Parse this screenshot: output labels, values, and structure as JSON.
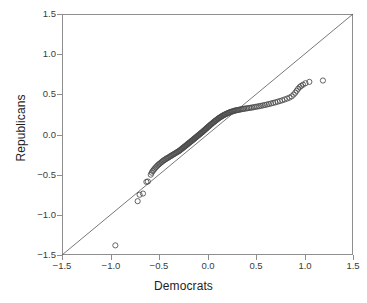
{
  "chart_data": {
    "type": "scatter",
    "title": "",
    "subtitle": "",
    "xlabel": "Democrats",
    "ylabel": "Republicans",
    "xlim": [
      -1.5,
      1.5
    ],
    "ylim": [
      -1.5,
      1.5
    ],
    "xticks": [
      "-1.5",
      "-1.0",
      "-0.5",
      "0.0",
      "0.5",
      "1.0",
      "1.5"
    ],
    "yticks": [
      "1.5",
      "1.0",
      "0.5",
      "0.0",
      "-0.5",
      "-1.0",
      "-1.5"
    ],
    "xtick_values": [
      -1.5,
      -1.0,
      -0.5,
      0.0,
      0.5,
      1.0,
      1.5
    ],
    "ytick_values": [
      1.5,
      1.0,
      0.5,
      0.0,
      -0.5,
      -1.0,
      -1.5
    ],
    "grid": false,
    "legend": "none",
    "annotations": [],
    "marker": {
      "shape": "open-circle",
      "radius": 2.6,
      "color": "#4a4a4a",
      "fill": "none"
    },
    "reference_line": {
      "name": "identity-line",
      "label": "y = x",
      "from": [
        -1.5,
        -1.5
      ],
      "to": [
        1.5,
        1.5
      ],
      "color": "#555555",
      "width": 0.8
    },
    "series": [
      {
        "name": "quantile-pairs",
        "points": [
          [
            -0.95,
            -1.38
          ],
          [
            -0.72,
            -0.83
          ],
          [
            -0.7,
            -0.75
          ],
          [
            -0.665,
            -0.735
          ],
          [
            -0.63,
            -0.59
          ],
          [
            -0.615,
            -0.585
          ],
          [
            -0.585,
            -0.5
          ],
          [
            -0.575,
            -0.475
          ],
          [
            -0.565,
            -0.455
          ],
          [
            -0.555,
            -0.44
          ],
          [
            -0.545,
            -0.425
          ],
          [
            -0.535,
            -0.41
          ],
          [
            -0.525,
            -0.4
          ],
          [
            -0.515,
            -0.385
          ],
          [
            -0.505,
            -0.375
          ],
          [
            -0.495,
            -0.365
          ],
          [
            -0.485,
            -0.355
          ],
          [
            -0.475,
            -0.345
          ],
          [
            -0.465,
            -0.335
          ],
          [
            -0.455,
            -0.325
          ],
          [
            -0.445,
            -0.318
          ],
          [
            -0.435,
            -0.31
          ],
          [
            -0.425,
            -0.3
          ],
          [
            -0.415,
            -0.295
          ],
          [
            -0.405,
            -0.288
          ],
          [
            -0.395,
            -0.28
          ],
          [
            -0.385,
            -0.272
          ],
          [
            -0.375,
            -0.265
          ],
          [
            -0.365,
            -0.258
          ],
          [
            -0.355,
            -0.25
          ],
          [
            -0.345,
            -0.243
          ],
          [
            -0.335,
            -0.236
          ],
          [
            -0.325,
            -0.228
          ],
          [
            -0.315,
            -0.221
          ],
          [
            -0.305,
            -0.214
          ],
          [
            -0.295,
            -0.207
          ],
          [
            -0.288,
            -0.2
          ],
          [
            -0.28,
            -0.193
          ],
          [
            -0.272,
            -0.186
          ],
          [
            -0.265,
            -0.178
          ],
          [
            -0.258,
            -0.171
          ],
          [
            -0.25,
            -0.164
          ],
          [
            -0.243,
            -0.157
          ],
          [
            -0.236,
            -0.15
          ],
          [
            -0.228,
            -0.143
          ],
          [
            -0.221,
            -0.136
          ],
          [
            -0.214,
            -0.129
          ],
          [
            -0.207,
            -0.122
          ],
          [
            -0.2,
            -0.115
          ],
          [
            -0.193,
            -0.108
          ],
          [
            -0.186,
            -0.101
          ],
          [
            -0.178,
            -0.094
          ],
          [
            -0.171,
            -0.087
          ],
          [
            -0.164,
            -0.08
          ],
          [
            -0.157,
            -0.073
          ],
          [
            -0.15,
            -0.066
          ],
          [
            -0.143,
            -0.059
          ],
          [
            -0.136,
            -0.052
          ],
          [
            -0.129,
            -0.045
          ],
          [
            -0.122,
            -0.038
          ],
          [
            -0.115,
            -0.031
          ],
          [
            -0.108,
            -0.024
          ],
          [
            -0.101,
            -0.017
          ],
          [
            -0.094,
            -0.01
          ],
          [
            -0.087,
            -0.003
          ],
          [
            -0.08,
            0.004
          ],
          [
            -0.073,
            0.011
          ],
          [
            -0.066,
            0.018
          ],
          [
            -0.059,
            0.025
          ],
          [
            -0.052,
            0.032
          ],
          [
            -0.045,
            0.04
          ],
          [
            -0.038,
            0.047
          ],
          [
            -0.031,
            0.055
          ],
          [
            -0.024,
            0.062
          ],
          [
            -0.017,
            0.07
          ],
          [
            -0.01,
            0.077
          ],
          [
            -0.003,
            0.085
          ],
          [
            0.004,
            0.092
          ],
          [
            0.011,
            0.1
          ],
          [
            0.018,
            0.107
          ],
          [
            0.025,
            0.115
          ],
          [
            0.032,
            0.122
          ],
          [
            0.04,
            0.13
          ],
          [
            0.047,
            0.137
          ],
          [
            0.055,
            0.145
          ],
          [
            0.062,
            0.152
          ],
          [
            0.07,
            0.16
          ],
          [
            0.077,
            0.167
          ],
          [
            0.085,
            0.174
          ],
          [
            0.092,
            0.181
          ],
          [
            0.1,
            0.188
          ],
          [
            0.108,
            0.195
          ],
          [
            0.115,
            0.202
          ],
          [
            0.122,
            0.208
          ],
          [
            0.13,
            0.214
          ],
          [
            0.138,
            0.22
          ],
          [
            0.146,
            0.226
          ],
          [
            0.154,
            0.232
          ],
          [
            0.162,
            0.238
          ],
          [
            0.17,
            0.243
          ],
          [
            0.178,
            0.248
          ],
          [
            0.186,
            0.253
          ],
          [
            0.195,
            0.258
          ],
          [
            0.204,
            0.263
          ],
          [
            0.213,
            0.268
          ],
          [
            0.222,
            0.273
          ],
          [
            0.231,
            0.277
          ],
          [
            0.24,
            0.281
          ],
          [
            0.25,
            0.285
          ],
          [
            0.26,
            0.289
          ],
          [
            0.27,
            0.293
          ],
          [
            0.281,
            0.297
          ],
          [
            0.292,
            0.3
          ],
          [
            0.303,
            0.303
          ],
          [
            0.315,
            0.306
          ],
          [
            0.327,
            0.309
          ],
          [
            0.34,
            0.312
          ],
          [
            0.353,
            0.315
          ],
          [
            0.367,
            0.318
          ],
          [
            0.381,
            0.321
          ],
          [
            0.396,
            0.324
          ],
          [
            0.411,
            0.327
          ],
          [
            0.427,
            0.33
          ],
          [
            0.443,
            0.333
          ],
          [
            0.46,
            0.336
          ],
          [
            0.477,
            0.34
          ],
          [
            0.495,
            0.344
          ],
          [
            0.513,
            0.348
          ],
          [
            0.532,
            0.352
          ],
          [
            0.551,
            0.357
          ],
          [
            0.571,
            0.362
          ],
          [
            0.591,
            0.367
          ],
          [
            0.612,
            0.373
          ],
          [
            0.633,
            0.379
          ],
          [
            0.655,
            0.386
          ],
          [
            0.677,
            0.393
          ],
          [
            0.7,
            0.4
          ],
          [
            0.723,
            0.408
          ],
          [
            0.747,
            0.417
          ],
          [
            0.771,
            0.426
          ],
          [
            0.795,
            0.436
          ],
          [
            0.82,
            0.447
          ],
          [
            0.845,
            0.459
          ],
          [
            0.868,
            0.475
          ],
          [
            0.888,
            0.497
          ],
          [
            0.905,
            0.52
          ],
          [
            0.92,
            0.545
          ],
          [
            0.935,
            0.57
          ],
          [
            0.95,
            0.59
          ],
          [
            0.965,
            0.605
          ],
          [
            0.985,
            0.62
          ],
          [
            1.01,
            0.638
          ],
          [
            1.05,
            0.655
          ],
          [
            1.19,
            0.672
          ]
        ]
      }
    ]
  }
}
